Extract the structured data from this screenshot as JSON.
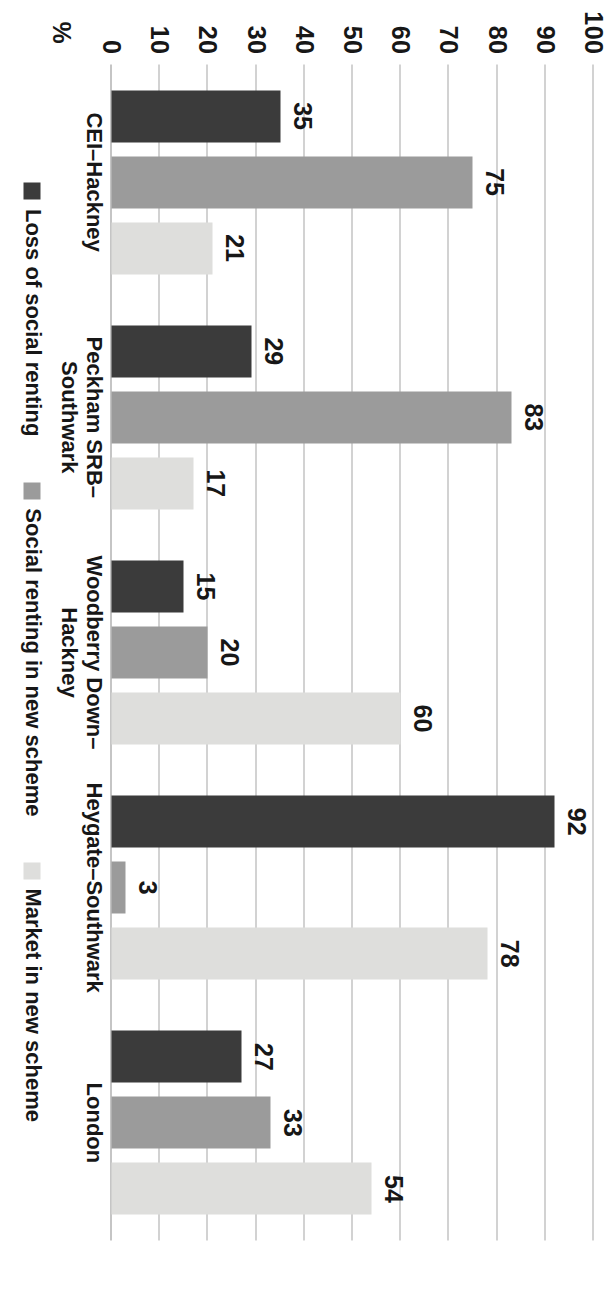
{
  "chart_data": {
    "type": "bar",
    "orientation": "horizontal-rotated",
    "title": "",
    "xlabel": "",
    "ylabel": "%",
    "ylim": [
      0,
      100
    ],
    "ytick_step": 10,
    "grid": true,
    "legend_position": "bottom",
    "categories": [
      "CEI–Hackney",
      "Peckham SRB–\nSouthwark",
      "Woodberry Down–\nHackney",
      "Heygate–Southwark",
      "London"
    ],
    "ticks": [
      "0",
      "10",
      "20",
      "30",
      "40",
      "50",
      "60",
      "70",
      "80",
      "90",
      "100"
    ],
    "series": [
      {
        "name": "Loss of social renting",
        "color": "#3b3b3b",
        "values": [
          35,
          29,
          15,
          92,
          27
        ]
      },
      {
        "name": "Social renting in new scheme",
        "color": "#9b9b9b",
        "values": [
          75,
          83,
          20,
          3,
          33
        ]
      },
      {
        "name": "Market in new scheme",
        "color": "#dededc",
        "values": [
          21,
          17,
          60,
          78,
          54
        ]
      }
    ]
  }
}
